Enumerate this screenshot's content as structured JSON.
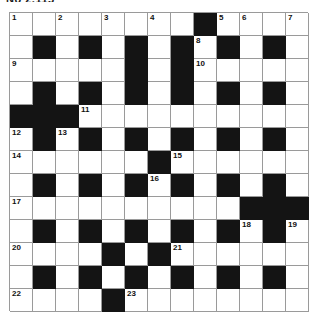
{
  "puzzle": {
    "heading": "No 2,115",
    "type": "crossword-grid",
    "rows": 13,
    "cols": 13,
    "colors": {
      "block": "#141414",
      "cell": "#ffffff",
      "gridline": "#9a9a9a",
      "number": "#111111"
    },
    "grid": [
      [
        {
          "block": false,
          "num": "1"
        },
        {
          "block": false,
          "num": ""
        },
        {
          "block": false,
          "num": "2"
        },
        {
          "block": false,
          "num": ""
        },
        {
          "block": false,
          "num": "3"
        },
        {
          "block": false,
          "num": ""
        },
        {
          "block": false,
          "num": "4"
        },
        {
          "block": false,
          "num": ""
        },
        {
          "block": true,
          "num": ""
        },
        {
          "block": false,
          "num": "5"
        },
        {
          "block": false,
          "num": "6"
        },
        {
          "block": false,
          "num": ""
        },
        {
          "block": false,
          "num": "7"
        }
      ],
      [
        {
          "block": false,
          "num": ""
        },
        {
          "block": true,
          "num": ""
        },
        {
          "block": false,
          "num": ""
        },
        {
          "block": true,
          "num": ""
        },
        {
          "block": false,
          "num": ""
        },
        {
          "block": true,
          "num": ""
        },
        {
          "block": false,
          "num": ""
        },
        {
          "block": true,
          "num": ""
        },
        {
          "block": false,
          "num": "8"
        },
        {
          "block": true,
          "num": ""
        },
        {
          "block": false,
          "num": ""
        },
        {
          "block": true,
          "num": ""
        },
        {
          "block": false,
          "num": ""
        }
      ],
      [
        {
          "block": false,
          "num": "9"
        },
        {
          "block": false,
          "num": ""
        },
        {
          "block": false,
          "num": ""
        },
        {
          "block": false,
          "num": ""
        },
        {
          "block": false,
          "num": ""
        },
        {
          "block": true,
          "num": ""
        },
        {
          "block": false,
          "num": ""
        },
        {
          "block": true,
          "num": ""
        },
        {
          "block": false,
          "num": "10"
        },
        {
          "block": false,
          "num": ""
        },
        {
          "block": false,
          "num": ""
        },
        {
          "block": false,
          "num": ""
        },
        {
          "block": false,
          "num": ""
        }
      ],
      [
        {
          "block": false,
          "num": ""
        },
        {
          "block": true,
          "num": ""
        },
        {
          "block": false,
          "num": ""
        },
        {
          "block": true,
          "num": ""
        },
        {
          "block": false,
          "num": ""
        },
        {
          "block": true,
          "num": ""
        },
        {
          "block": false,
          "num": ""
        },
        {
          "block": true,
          "num": ""
        },
        {
          "block": false,
          "num": ""
        },
        {
          "block": true,
          "num": ""
        },
        {
          "block": false,
          "num": ""
        },
        {
          "block": true,
          "num": ""
        },
        {
          "block": false,
          "num": ""
        }
      ],
      [
        {
          "block": true,
          "num": ""
        },
        {
          "block": true,
          "num": ""
        },
        {
          "block": true,
          "num": ""
        },
        {
          "block": false,
          "num": "11"
        },
        {
          "block": false,
          "num": ""
        },
        {
          "block": false,
          "num": ""
        },
        {
          "block": false,
          "num": ""
        },
        {
          "block": false,
          "num": ""
        },
        {
          "block": false,
          "num": ""
        },
        {
          "block": false,
          "num": ""
        },
        {
          "block": false,
          "num": ""
        },
        {
          "block": false,
          "num": ""
        },
        {
          "block": false,
          "num": ""
        }
      ],
      [
        {
          "block": false,
          "num": "12"
        },
        {
          "block": true,
          "num": ""
        },
        {
          "block": false,
          "num": "13"
        },
        {
          "block": true,
          "num": ""
        },
        {
          "block": false,
          "num": ""
        },
        {
          "block": true,
          "num": ""
        },
        {
          "block": false,
          "num": ""
        },
        {
          "block": true,
          "num": ""
        },
        {
          "block": false,
          "num": ""
        },
        {
          "block": true,
          "num": ""
        },
        {
          "block": false,
          "num": ""
        },
        {
          "block": true,
          "num": ""
        },
        {
          "block": false,
          "num": ""
        }
      ],
      [
        {
          "block": false,
          "num": "14"
        },
        {
          "block": false,
          "num": ""
        },
        {
          "block": false,
          "num": ""
        },
        {
          "block": false,
          "num": ""
        },
        {
          "block": false,
          "num": ""
        },
        {
          "block": false,
          "num": ""
        },
        {
          "block": true,
          "num": ""
        },
        {
          "block": false,
          "num": "15"
        },
        {
          "block": false,
          "num": ""
        },
        {
          "block": false,
          "num": ""
        },
        {
          "block": false,
          "num": ""
        },
        {
          "block": false,
          "num": ""
        },
        {
          "block": false,
          "num": ""
        }
      ],
      [
        {
          "block": false,
          "num": ""
        },
        {
          "block": true,
          "num": ""
        },
        {
          "block": false,
          "num": ""
        },
        {
          "block": true,
          "num": ""
        },
        {
          "block": false,
          "num": ""
        },
        {
          "block": true,
          "num": ""
        },
        {
          "block": false,
          "num": "16"
        },
        {
          "block": true,
          "num": ""
        },
        {
          "block": false,
          "num": ""
        },
        {
          "block": true,
          "num": ""
        },
        {
          "block": false,
          "num": ""
        },
        {
          "block": true,
          "num": ""
        },
        {
          "block": false,
          "num": ""
        }
      ],
      [
        {
          "block": false,
          "num": "17"
        },
        {
          "block": false,
          "num": ""
        },
        {
          "block": false,
          "num": ""
        },
        {
          "block": false,
          "num": ""
        },
        {
          "block": false,
          "num": ""
        },
        {
          "block": false,
          "num": ""
        },
        {
          "block": false,
          "num": ""
        },
        {
          "block": false,
          "num": ""
        },
        {
          "block": false,
          "num": ""
        },
        {
          "block": false,
          "num": ""
        },
        {
          "block": true,
          "num": ""
        },
        {
          "block": true,
          "num": ""
        },
        {
          "block": true,
          "num": ""
        }
      ],
      [
        {
          "block": false,
          "num": ""
        },
        {
          "block": true,
          "num": ""
        },
        {
          "block": false,
          "num": ""
        },
        {
          "block": true,
          "num": ""
        },
        {
          "block": false,
          "num": ""
        },
        {
          "block": true,
          "num": ""
        },
        {
          "block": false,
          "num": ""
        },
        {
          "block": true,
          "num": ""
        },
        {
          "block": false,
          "num": ""
        },
        {
          "block": true,
          "num": ""
        },
        {
          "block": false,
          "num": "18"
        },
        {
          "block": true,
          "num": ""
        },
        {
          "block": false,
          "num": "19"
        }
      ],
      [
        {
          "block": false,
          "num": "20"
        },
        {
          "block": false,
          "num": ""
        },
        {
          "block": false,
          "num": ""
        },
        {
          "block": false,
          "num": ""
        },
        {
          "block": true,
          "num": ""
        },
        {
          "block": false,
          "num": ""
        },
        {
          "block": true,
          "num": ""
        },
        {
          "block": false,
          "num": "21"
        },
        {
          "block": false,
          "num": ""
        },
        {
          "block": false,
          "num": ""
        },
        {
          "block": false,
          "num": ""
        },
        {
          "block": false,
          "num": ""
        },
        {
          "block": false,
          "num": ""
        }
      ],
      [
        {
          "block": false,
          "num": ""
        },
        {
          "block": true,
          "num": ""
        },
        {
          "block": false,
          "num": ""
        },
        {
          "block": true,
          "num": ""
        },
        {
          "block": false,
          "num": ""
        },
        {
          "block": true,
          "num": ""
        },
        {
          "block": false,
          "num": ""
        },
        {
          "block": true,
          "num": ""
        },
        {
          "block": false,
          "num": ""
        },
        {
          "block": true,
          "num": ""
        },
        {
          "block": false,
          "num": ""
        },
        {
          "block": true,
          "num": ""
        },
        {
          "block": false,
          "num": ""
        }
      ],
      [
        {
          "block": false,
          "num": "22"
        },
        {
          "block": false,
          "num": ""
        },
        {
          "block": false,
          "num": ""
        },
        {
          "block": false,
          "num": ""
        },
        {
          "block": true,
          "num": ""
        },
        {
          "block": false,
          "num": "23"
        },
        {
          "block": false,
          "num": ""
        },
        {
          "block": false,
          "num": ""
        },
        {
          "block": false,
          "num": ""
        },
        {
          "block": false,
          "num": ""
        },
        {
          "block": false,
          "num": ""
        },
        {
          "block": false,
          "num": ""
        },
        {
          "block": false,
          "num": ""
        }
      ]
    ]
  }
}
